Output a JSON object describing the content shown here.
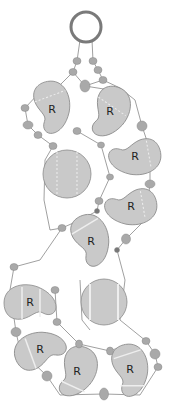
{
  "diagram": {
    "colors": {
      "background": "#ffffff",
      "bead_fill": "#c9c9c9",
      "bead_stroke": "#8a8a8a",
      "small_bead": "#a9a9a9",
      "ring": "#7a7a7a",
      "thread": "#888888",
      "highlight": "#eeeeee",
      "label": "#222222"
    },
    "ring": {
      "cx": 86,
      "cy": 27,
      "r": 15
    },
    "paisley_beads": [
      {
        "label": "R",
        "cx": 52,
        "cy": 107,
        "rot": -10
      },
      {
        "label": "R",
        "cx": 110,
        "cy": 112,
        "rot": 20
      },
      {
        "label": "R",
        "cx": 135,
        "cy": 157,
        "rot": 80
      },
      {
        "label": "R",
        "cx": 131,
        "cy": 207,
        "rot": 80
      },
      {
        "label": "R",
        "cx": 91,
        "cy": 240,
        "rot": -20
      },
      {
        "label": "R",
        "cx": 30,
        "cy": 303,
        "rot": -90
      },
      {
        "label": "R",
        "cx": 40,
        "cy": 350,
        "rot": -110
      },
      {
        "label": "R",
        "cx": 77,
        "cy": 372,
        "rot": 20
      },
      {
        "label": "R",
        "cx": 130,
        "cy": 370,
        "rot": -10
      }
    ],
    "disc_beads": [
      {
        "cx": 67,
        "cy": 174,
        "r": 24
      },
      {
        "cx": 104,
        "cy": 302,
        "r": 23
      }
    ],
    "small_beads": [
      {
        "cx": 77,
        "cy": 61
      },
      {
        "cx": 93,
        "cy": 61
      },
      {
        "cx": 73,
        "cy": 72
      },
      {
        "cx": 98,
        "cy": 70
      },
      {
        "cx": 85,
        "cy": 86
      },
      {
        "cx": 103,
        "cy": 80
      },
      {
        "cx": 25,
        "cy": 108
      },
      {
        "cx": 28,
        "cy": 125
      },
      {
        "cx": 38,
        "cy": 135
      },
      {
        "cx": 77,
        "cy": 131
      },
      {
        "cx": 142,
        "cy": 126
      },
      {
        "cx": 53,
        "cy": 146
      },
      {
        "cx": 101,
        "cy": 145
      },
      {
        "cx": 110,
        "cy": 177
      },
      {
        "cx": 150,
        "cy": 184
      },
      {
        "cx": 99,
        "cy": 201
      },
      {
        "cx": 97,
        "cy": 211
      },
      {
        "cx": 62,
        "cy": 228
      },
      {
        "cx": 126,
        "cy": 239
      },
      {
        "cx": 117,
        "cy": 250
      },
      {
        "cx": 14,
        "cy": 267
      },
      {
        "cx": 55,
        "cy": 290
      },
      {
        "cx": 57,
        "cy": 322
      },
      {
        "cx": 16,
        "cy": 332
      },
      {
        "cx": 79,
        "cy": 344
      },
      {
        "cx": 110,
        "cy": 351
      },
      {
        "cx": 146,
        "cy": 341
      },
      {
        "cx": 155,
        "cy": 354
      },
      {
        "cx": 158,
        "cy": 367
      },
      {
        "cx": 47,
        "cy": 376
      },
      {
        "cx": 104,
        "cy": 394
      }
    ]
  }
}
